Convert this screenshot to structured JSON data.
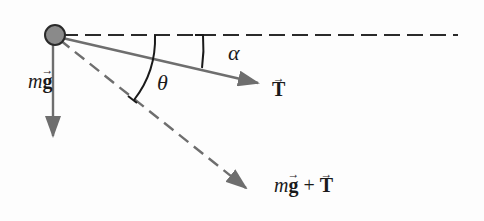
{
  "diagram": {
    "title": "",
    "labels": {
      "weight_m": "m",
      "weight_g": "g",
      "tension": "T",
      "alpha": "α",
      "theta": "θ",
      "sum_m": "m",
      "sum_g": "g",
      "sum_plus": "+",
      "sum_T": "T"
    },
    "colors": {
      "ball_fill": "#8a8a8a",
      "ball_stroke": "#2a2a2a",
      "arrow": "#6e6e6e",
      "dashed_line": "#2a2a2a",
      "arc": "#1a1a1a",
      "text": "#1a1a1a"
    },
    "elements": [
      {
        "id": "ball",
        "type": "circle",
        "center": [
          55,
          35
        ],
        "radius": 10
      },
      {
        "id": "horizontal-reference",
        "type": "dashed-line",
        "from": [
          62,
          35
        ],
        "to": [
          458,
          35
        ]
      },
      {
        "id": "weight-vector",
        "type": "arrow",
        "from": [
          53,
          38
        ],
        "to": [
          53,
          135
        ],
        "label": "mg"
      },
      {
        "id": "tension-vector",
        "type": "arrow",
        "from": [
          58,
          37
        ],
        "to": [
          258,
          83
        ],
        "label": "T"
      },
      {
        "id": "resultant-vector",
        "type": "dashed-arrow",
        "from": [
          60,
          40
        ],
        "to": [
          246,
          188
        ],
        "label": "mg + T"
      },
      {
        "id": "angle-theta",
        "type": "arc",
        "between": [
          "horizontal-reference",
          "resultant-vector"
        ],
        "label": "θ"
      },
      {
        "id": "angle-alpha",
        "type": "arc",
        "between": [
          "horizontal-reference",
          "tension-vector"
        ],
        "label": "α"
      }
    ]
  }
}
